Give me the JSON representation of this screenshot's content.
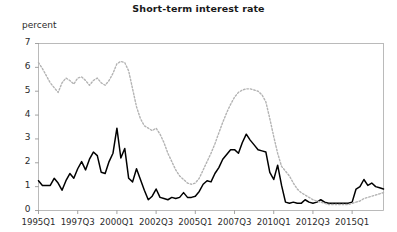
{
  "chart_data": {
    "type": "line",
    "title": "Short-term interest rate",
    "ylabel": "percent",
    "xlabel": "",
    "ylim": [
      0,
      7
    ],
    "yticks": [
      0,
      1,
      2,
      3,
      4,
      5,
      6,
      7
    ],
    "ytick_labels": [
      "0",
      "1",
      "2",
      "3",
      "4",
      "5",
      "6",
      "7"
    ],
    "grid": false,
    "legend": "none",
    "xtick_labels": [
      "1995Q1",
      "1997Q3",
      "2000Q1",
      "2002Q3",
      "2005Q1",
      "2007Q3",
      "2010Q1",
      "2012Q3",
      "2015Q1"
    ],
    "xtick_indices": [
      0,
      10,
      20,
      30,
      40,
      50,
      60,
      70,
      80
    ],
    "x_count": 89,
    "x_start": "1995Q1",
    "x_end": "2017Q1",
    "series": [
      {
        "name": "series-solid",
        "style": "solid",
        "color": "#000000",
        "values": [
          1.25,
          1.05,
          1.05,
          1.05,
          1.35,
          1.15,
          0.85,
          1.25,
          1.55,
          1.35,
          1.75,
          2.05,
          1.7,
          2.15,
          2.45,
          2.3,
          1.6,
          1.55,
          2.05,
          2.4,
          3.45,
          2.2,
          2.6,
          1.35,
          1.2,
          1.75,
          1.3,
          0.85,
          0.45,
          0.6,
          0.9,
          0.55,
          0.5,
          0.45,
          0.55,
          0.5,
          0.55,
          0.75,
          0.55,
          0.55,
          0.6,
          0.8,
          1.1,
          1.25,
          1.2,
          1.55,
          1.8,
          2.15,
          2.35,
          2.55,
          2.55,
          2.4,
          2.85,
          3.2,
          2.95,
          2.75,
          2.55,
          2.5,
          2.45,
          1.6,
          1.3,
          1.9,
          1.05,
          0.35,
          0.3,
          0.35,
          0.3,
          0.3,
          0.45,
          0.35,
          0.3,
          0.35,
          0.45,
          0.35,
          0.3,
          0.3,
          0.3,
          0.3,
          0.3,
          0.3,
          0.35,
          0.9,
          1.0,
          1.3,
          1.05,
          1.15,
          1.0,
          0.95,
          0.9
        ]
      },
      {
        "name": "series-dotted",
        "style": "dotted",
        "color": "#b3b3b3",
        "values": [
          6.2,
          5.95,
          5.65,
          5.35,
          5.15,
          4.95,
          5.35,
          5.55,
          5.45,
          5.3,
          5.55,
          5.6,
          5.45,
          5.25,
          5.45,
          5.55,
          5.35,
          5.25,
          5.45,
          5.75,
          6.15,
          6.25,
          6.2,
          5.85,
          5.1,
          4.35,
          3.85,
          3.55,
          3.45,
          3.35,
          3.45,
          3.2,
          2.85,
          2.4,
          2.05,
          1.7,
          1.45,
          1.3,
          1.15,
          1.1,
          1.15,
          1.35,
          1.7,
          2.05,
          2.4,
          2.8,
          3.25,
          3.7,
          4.1,
          4.45,
          4.75,
          4.95,
          5.05,
          5.1,
          5.1,
          5.05,
          5.0,
          4.85,
          4.55,
          3.85,
          3.1,
          2.4,
          1.85,
          1.65,
          1.45,
          1.15,
          0.9,
          0.75,
          0.65,
          0.55,
          0.45,
          0.4,
          0.35,
          0.3,
          0.25,
          0.25,
          0.25,
          0.25,
          0.25,
          0.25,
          0.3,
          0.35,
          0.4,
          0.5,
          0.55,
          0.6,
          0.65,
          0.7,
          0.75
        ]
      }
    ]
  }
}
